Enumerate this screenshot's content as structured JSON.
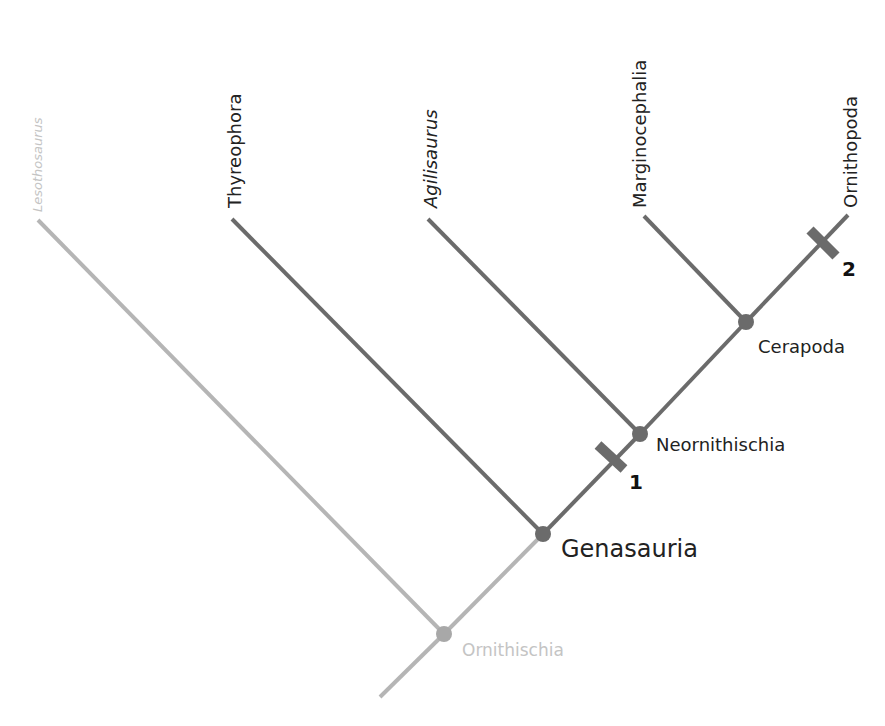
{
  "colors": {
    "branch_dark": "#6b6b6b",
    "branch_light": "#b5b5b5",
    "node_dark": "#6b6b6b",
    "node_light": "#a8a8a8",
    "text_dark": "#222222",
    "text_light": "#c4c4c4"
  },
  "terminal_taxa": [
    {
      "name": "Lesothosaurus",
      "italic": true,
      "faded": true
    },
    {
      "name": "Thyreophora",
      "italic": false,
      "faded": false
    },
    {
      "name": "Agilisaurus",
      "italic": true,
      "faded": false
    },
    {
      "name": "Marginocephalia",
      "italic": false,
      "faded": false
    },
    {
      "name": "Ornithopoda",
      "italic": false,
      "faded": false
    }
  ],
  "nodes": [
    {
      "name": "Ornithischia",
      "faded": true
    },
    {
      "name": "Genasauria",
      "faded": false
    },
    {
      "name": "Neornithischia",
      "faded": false
    },
    {
      "name": "Cerapoda",
      "faded": false
    }
  ],
  "character_markers": [
    {
      "label": "1",
      "branch": "Genasauria–Neornithischia"
    },
    {
      "label": "2",
      "branch": "Ornithopoda"
    }
  ]
}
